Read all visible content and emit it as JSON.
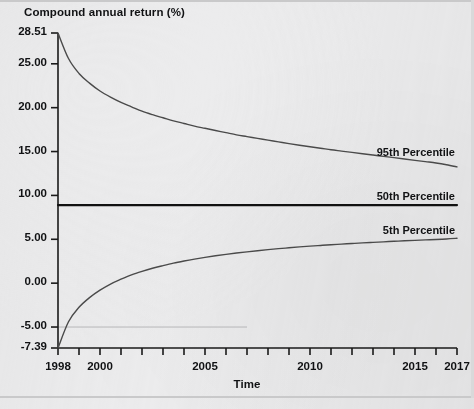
{
  "figure": {
    "background_color": "#ececed",
    "axis_color": "#1a1a1a",
    "curve_color": "#4a4a4a",
    "median_color": "#111111",
    "reference_line_color": "#b6b6b8"
  },
  "chart_data": {
    "type": "line",
    "title": "Compound annual return (%)",
    "xlabel": "Time",
    "ylabel": "Compound annual return (%)",
    "xlim": [
      1998,
      2017
    ],
    "ylim": [
      -7.39,
      28.51
    ],
    "grid": false,
    "legend_position": "inline-right",
    "x_ticks": [
      1998,
      1999,
      2000,
      2001,
      2002,
      2003,
      2004,
      2005,
      2006,
      2007,
      2008,
      2009,
      2010,
      2011,
      2012,
      2013,
      2014,
      2015,
      2016,
      2017
    ],
    "x_tick_labels": [
      {
        "value": 1998,
        "label": "1998"
      },
      {
        "value": 2000,
        "label": "2000"
      },
      {
        "value": 2005,
        "label": "2005"
      },
      {
        "value": 2010,
        "label": "2010"
      },
      {
        "value": 2015,
        "label": "2015"
      },
      {
        "value": 2017,
        "label": "2017"
      }
    ],
    "y_tick_labels": [
      {
        "value": 28.51,
        "label": "28.51"
      },
      {
        "value": 25.0,
        "label": "25.00"
      },
      {
        "value": 20.0,
        "label": "20.00"
      },
      {
        "value": 15.0,
        "label": "15.00"
      },
      {
        "value": 10.0,
        "label": "10.00"
      },
      {
        "value": 5.0,
        "label": "5.00"
      },
      {
        "value": 0.0,
        "label": "0.00"
      },
      {
        "value": -5.0,
        "label": "-5.00"
      },
      {
        "value": -7.39,
        "label": "-7.39"
      }
    ],
    "annotations": [
      {
        "name": "reference-line",
        "y": -5.0,
        "x_start": 1998,
        "x_end": 2007,
        "style": "thin-light"
      }
    ],
    "x": [
      1998,
      1998.5,
      1999,
      1999.5,
      2000,
      2000.5,
      2001,
      2001.5,
      2002,
      2002.5,
      2003,
      2003.5,
      2004,
      2004.5,
      2005,
      2005.5,
      2006,
      2006.5,
      2007,
      2007.5,
      2008,
      2008.5,
      2009,
      2009.5,
      2010,
      2010.5,
      2011,
      2011.5,
      2012,
      2012.5,
      2013,
      2013.5,
      2014,
      2014.5,
      2015,
      2015.5,
      2016,
      2016.5,
      2017
    ],
    "series": [
      {
        "name": "95th Percentile",
        "label": "95th Percentile",
        "color": "#4a4a4a",
        "width": 1.4,
        "values": [
          28.51,
          25.6,
          23.9,
          22.8,
          21.9,
          21.2,
          20.6,
          20.1,
          19.6,
          19.2,
          18.85,
          18.5,
          18.2,
          17.9,
          17.65,
          17.4,
          17.15,
          16.9,
          16.7,
          16.5,
          16.3,
          16.1,
          15.9,
          15.72,
          15.55,
          15.38,
          15.2,
          15.05,
          14.9,
          14.75,
          14.6,
          14.45,
          14.3,
          14.15,
          14.0,
          13.85,
          13.7,
          13.5,
          13.25
        ]
      },
      {
        "name": "50th Percentile",
        "label": "50th Percentile",
        "color": "#111111",
        "width": 2.2,
        "values": [
          8.9,
          8.9,
          8.9,
          8.9,
          8.9,
          8.9,
          8.9,
          8.9,
          8.9,
          8.9,
          8.9,
          8.9,
          8.9,
          8.9,
          8.9,
          8.9,
          8.9,
          8.9,
          8.9,
          8.9,
          8.9,
          8.9,
          8.9,
          8.9,
          8.9,
          8.9,
          8.9,
          8.9,
          8.9,
          8.9,
          8.9,
          8.9,
          8.9,
          8.9,
          8.9,
          8.9,
          8.9,
          8.9,
          8.9
        ]
      },
      {
        "name": "5th Percentile",
        "label": "5th Percentile",
        "color": "#4a4a4a",
        "width": 1.4,
        "values": [
          -7.39,
          -4.4,
          -2.75,
          -1.65,
          -0.8,
          -0.1,
          0.45,
          0.95,
          1.35,
          1.7,
          2.0,
          2.28,
          2.52,
          2.74,
          2.94,
          3.12,
          3.28,
          3.43,
          3.57,
          3.7,
          3.82,
          3.93,
          4.03,
          4.13,
          4.22,
          4.3,
          4.38,
          4.45,
          4.52,
          4.59,
          4.65,
          4.71,
          4.77,
          4.83,
          4.88,
          4.93,
          4.98,
          5.04,
          5.12
        ]
      }
    ]
  },
  "labels": {
    "series_95": "95th Percentile",
    "series_50": "50th Percentile",
    "series_5": "5th Percentile"
  }
}
